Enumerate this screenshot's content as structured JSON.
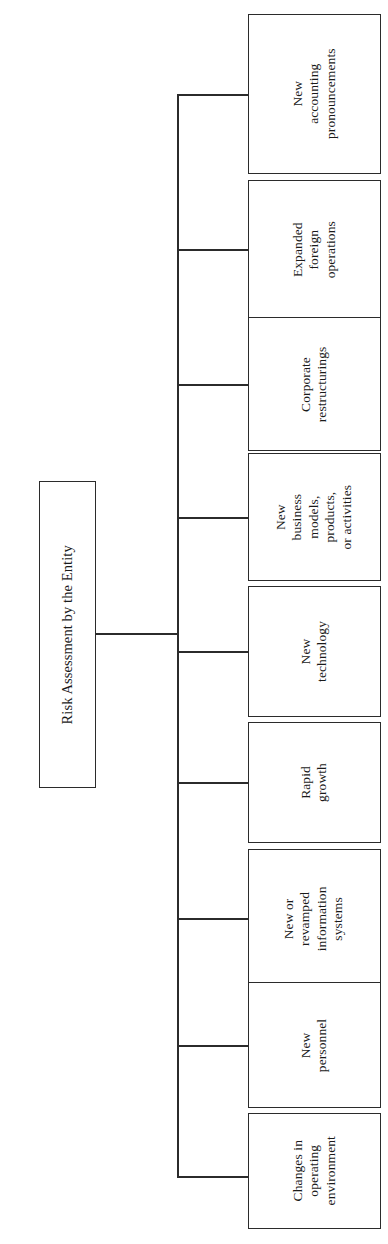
{
  "diagram": {
    "type": "organizational-tree",
    "orientation": "horizontal-rotated",
    "root": {
      "id": "risk-assessment-entity",
      "label": "Risk Assessment by the Entity"
    },
    "children": [
      {
        "id": "new-accounting-pronouncements",
        "label": "New\naccounting\npronouncements",
        "lines": 3
      },
      {
        "id": "expanded-foreign-operations",
        "label": "Expanded\nforeign\noperations",
        "lines": 3
      },
      {
        "id": "corporate-restructurings",
        "label": "Corporate\nrestructurings",
        "lines": 2
      },
      {
        "id": "new-business-models",
        "label": "New\nbusiness\nmodels,\nproducts,\nor activities",
        "lines": 5
      },
      {
        "id": "new-technology",
        "label": "New\ntechnology",
        "lines": 2
      },
      {
        "id": "rapid-growth",
        "label": "Rapid\ngrowth",
        "lines": 2
      },
      {
        "id": "new-revamped-information-systems",
        "label": "New or\nrevamped\ninformation\nsystems",
        "lines": 4
      },
      {
        "id": "new-personnel",
        "label": "New\npersonnel",
        "lines": 2
      },
      {
        "id": "changes-in-operating-environment",
        "label": "Changes in\noperating\nenvironment",
        "lines": 3
      }
    ]
  },
  "style": {
    "border_color": "#2b2b2b",
    "background_color": "#ffffff",
    "text_color": "#1a1a1a"
  },
  "layout": {
    "trunk_x": 177,
    "child_left": 248,
    "child_width": 133,
    "boxes": [
      {
        "top": 14,
        "height": 160
      },
      {
        "top": 180,
        "height": 139
      },
      {
        "top": 317,
        "height": 134
      },
      {
        "top": 453,
        "height": 128
      },
      {
        "top": 586,
        "height": 131
      },
      {
        "top": 722,
        "height": 121
      },
      {
        "top": 849,
        "height": 139
      },
      {
        "top": 982,
        "height": 126
      },
      {
        "top": 1113,
        "height": 116
      }
    ]
  }
}
